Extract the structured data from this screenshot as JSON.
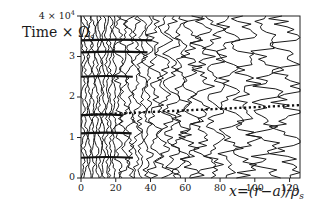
{
  "chart_data": {
    "type": "contour",
    "title": "",
    "ylabel": "Time × Ω",
    "ylabel_subscript": "s",
    "xlabel": "x=(r−a)/ρ",
    "xlabel_subscript": "s",
    "x_ticks": [
      0,
      20,
      40,
      60,
      80,
      100,
      120
    ],
    "x_tick_labels": [
      "0",
      "20",
      "40",
      "60",
      "80",
      "100",
      "120"
    ],
    "y_ticks": [
      0,
      1,
      2,
      3,
      4
    ],
    "y_tick_labels": [
      "0",
      "1",
      "2",
      "3",
      "4 × 10"
    ],
    "y_top_exponent": "4",
    "xlim": [
      0,
      126
    ],
    "ylim": [
      0,
      40000
    ],
    "y_scale_factor": 10000,
    "grid": false,
    "legend": null,
    "annotations": [
      {
        "type": "dotted-line",
        "description": "front propagation line",
        "x": [
          0,
          126
        ],
        "y": [
          15500,
          18000
        ]
      }
    ],
    "contour_density": {
      "x_ranges": [
        [
          0,
          20
        ],
        [
          20,
          40
        ],
        [
          40,
          60
        ],
        [
          60,
          80
        ],
        [
          80,
          100
        ],
        [
          100,
          126
        ]
      ],
      "lines_per_range": [
        10,
        6,
        4,
        3,
        2,
        2
      ]
    },
    "bursts_y": [
      5000,
      11000,
      15500,
      25000,
      31000,
      34000
    ]
  },
  "labels": {
    "ylabel_main": "Time × Ω",
    "ylabel_sub": "s",
    "xlabel_main": "x=(r−a)/ρ",
    "xlabel_sub": "s"
  }
}
